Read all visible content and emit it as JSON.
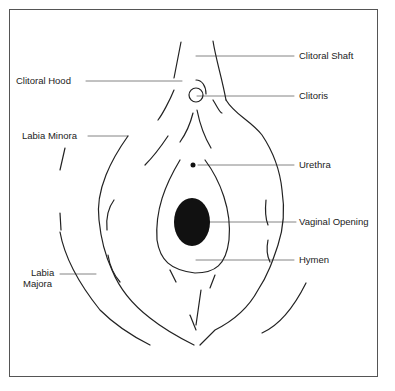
{
  "diagram": {
    "type": "anatomical-illustration",
    "colors": {
      "line": "#222222",
      "frame": "#555555",
      "fill": "#111111"
    },
    "labels": [
      {
        "id": "clitoral-shaft",
        "text": "Clitoral Shaft"
      },
      {
        "id": "clitoral-hood",
        "text": "Clitoral Hood"
      },
      {
        "id": "clitoris",
        "text": "Clitoris"
      },
      {
        "id": "labia-minora",
        "text": "Labia Minora"
      },
      {
        "id": "urethra",
        "text": "Urethra"
      },
      {
        "id": "vaginal-opening",
        "text": "Vaginal Opening"
      },
      {
        "id": "hymen",
        "text": "Hymen"
      },
      {
        "id": "labia-majora-line1",
        "text": "Labia"
      },
      {
        "id": "labia-majora-line2",
        "text": "Majora"
      }
    ]
  }
}
